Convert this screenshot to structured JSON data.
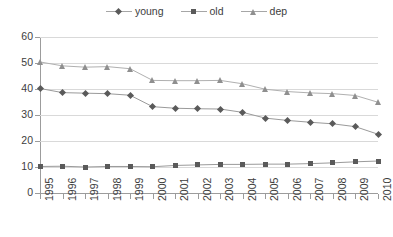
{
  "chart_data": {
    "type": "line",
    "title": "",
    "xlabel": "",
    "ylabel": "",
    "ylim": [
      0,
      60
    ],
    "ytick_step": 10,
    "yticks": [
      "0",
      "10",
      "20",
      "30",
      "40",
      "50",
      "60"
    ],
    "grid": true,
    "legend_position": "top-center",
    "categories": [
      "1995",
      "1996",
      "1997",
      "1998",
      "1999",
      "2000",
      "2001",
      "2002",
      "2003",
      "2004",
      "2005",
      "2006",
      "2007",
      "2008",
      "2009",
      "2010"
    ],
    "series": [
      {
        "name": "young",
        "marker": "diamond",
        "color": "#5a5a5a",
        "values": [
          40.2,
          38.6,
          38.4,
          38.2,
          37.6,
          33.2,
          32.6,
          32.4,
          32.3,
          31.0,
          28.8,
          27.9,
          27.2,
          26.6,
          25.5,
          22.6
        ]
      },
      {
        "name": "old",
        "marker": "square",
        "color": "#5a5a5a",
        "values": [
          10.2,
          10.3,
          10.0,
          10.2,
          10.2,
          10.1,
          10.6,
          10.8,
          11.0,
          11.0,
          11.1,
          11.1,
          11.3,
          11.6,
          12.0,
          12.3
        ]
      },
      {
        "name": "dep",
        "marker": "triangle",
        "color": "#8f8f8f",
        "values": [
          50.4,
          48.9,
          48.4,
          48.6,
          47.8,
          43.3,
          43.2,
          43.2,
          43.3,
          42.0,
          39.9,
          39.0,
          38.5,
          38.2,
          37.5,
          34.9
        ]
      }
    ]
  }
}
